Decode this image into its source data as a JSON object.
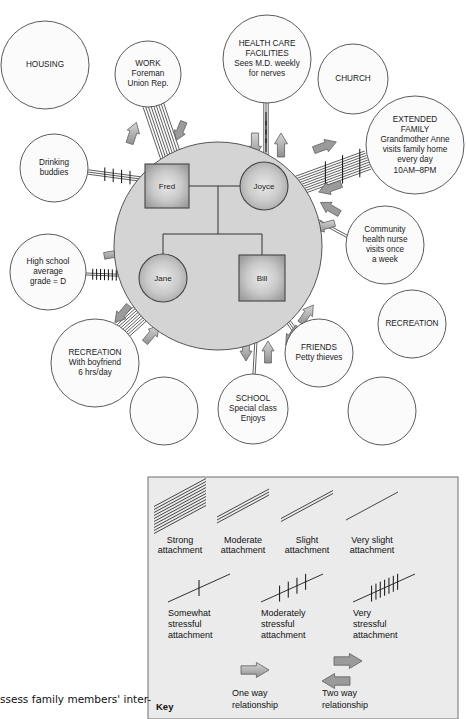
{
  "figure": {
    "type": "ecomap",
    "caption": "ssess family members' inter-"
  },
  "family": {
    "label": "family-unit",
    "members": [
      {
        "name": "Fred",
        "shape": "square",
        "role": "father"
      },
      {
        "name": "Joyce",
        "shape": "circle",
        "role": "mother"
      },
      {
        "name": "Jane",
        "shape": "circle",
        "role": "daughter"
      },
      {
        "name": "Bill",
        "shape": "square",
        "role": "son"
      }
    ]
  },
  "eco_nodes": [
    {
      "id": "housing",
      "lines": [
        "HOUSING"
      ],
      "empty": false
    },
    {
      "id": "work",
      "lines": [
        "WORK",
        "Foreman",
        "Union Rep."
      ],
      "empty": false
    },
    {
      "id": "health_care",
      "lines": [
        "HEALTH CARE",
        "FACILITIES",
        "Sees M.D. weekly",
        "for nerves"
      ],
      "empty": false
    },
    {
      "id": "church",
      "lines": [
        "CHURCH"
      ],
      "empty": false
    },
    {
      "id": "extended_family",
      "lines": [
        "EXTENDED",
        "FAMILY",
        "Grandmother Anne",
        "visits family home",
        "every day",
        "10AM–8PM"
      ],
      "empty": false
    },
    {
      "id": "drinking_buddies",
      "lines": [
        "Drinking",
        "buddies"
      ],
      "empty": false
    },
    {
      "id": "community_nurse",
      "lines": [
        "Community",
        "health nurse",
        "visits once",
        "a week"
      ],
      "empty": false
    },
    {
      "id": "high_school",
      "lines": [
        "High school",
        "average",
        "grade = D"
      ],
      "empty": false
    },
    {
      "id": "recreation_right",
      "lines": [
        "RECREATION"
      ],
      "empty": false
    },
    {
      "id": "recreation_jane",
      "lines": [
        "RECREATION",
        "With boyfriend",
        "6 hrs/day"
      ],
      "empty": false
    },
    {
      "id": "friends",
      "lines": [
        "FRIENDS",
        "Petty thieves"
      ],
      "empty": false
    },
    {
      "id": "school",
      "lines": [
        "SCHOOL",
        "Special class",
        "Enjoys"
      ],
      "empty": false
    },
    {
      "id": "blank_1",
      "lines": [],
      "empty": true
    },
    {
      "id": "blank_2",
      "lines": [],
      "empty": true
    },
    {
      "id": "blank_3",
      "lines": [],
      "empty": true
    }
  ],
  "connections": [
    {
      "from": "work",
      "to": "Fred",
      "attachment": "strong",
      "stress": "none",
      "direction": "two-way"
    },
    {
      "from": "drinking_buddies",
      "to": "Fred",
      "attachment": "moderate",
      "stress": "moderately",
      "direction": "none"
    },
    {
      "from": "health_care",
      "to": "Joyce",
      "attachment": "moderate",
      "stress": "moderately",
      "direction": "two-way"
    },
    {
      "from": "extended_family",
      "to": "Joyce",
      "attachment": "strong",
      "stress": "moderately",
      "direction": "two-way"
    },
    {
      "from": "community_nurse",
      "to": "Joyce",
      "attachment": "slight",
      "stress": "none",
      "direction": "two-way"
    },
    {
      "from": "high_school",
      "to": "Jane",
      "attachment": "slight",
      "stress": "very",
      "direction": "one-way"
    },
    {
      "from": "recreation_jane",
      "to": "Jane",
      "attachment": "strong",
      "stress": "none",
      "direction": "two-way"
    },
    {
      "from": "friends",
      "to": "Bill",
      "attachment": "moderate",
      "stress": "none",
      "direction": "two-way"
    },
    {
      "from": "school",
      "to": "Bill",
      "attachment": "slight",
      "stress": "none",
      "direction": "two-way"
    }
  ],
  "legend": {
    "key_word": "Key",
    "attachment_items": [
      {
        "label_line1": "Strong",
        "label_line2": "attachment",
        "lines": 10
      },
      {
        "label_line1": "Moderate",
        "label_line2": "attachment",
        "lines": 3
      },
      {
        "label_line1": "Slight",
        "label_line2": "attachment",
        "lines": 2
      },
      {
        "label_line1": "Very slight",
        "label_line2": "attachment",
        "lines": 1
      }
    ],
    "stress_items": [
      {
        "label_line1": "Somewhat",
        "label_line2": "stressful",
        "label_line3": "attachment",
        "hashes": 1
      },
      {
        "label_line1": "Moderately",
        "label_line2": "stressful",
        "label_line3": "attachment",
        "hashes": 4
      },
      {
        "label_line1": "Very",
        "label_line2": "stressful",
        "label_line3": "attachment",
        "hashes": 7
      }
    ],
    "relationship_items": [
      {
        "label_line1": "One way",
        "label_line2": "relationship",
        "arrows": 1
      },
      {
        "label_line1": "Two way",
        "label_line2": "relationship",
        "arrows": 2
      }
    ]
  },
  "colors": {
    "eco_circle_fill": "#fbfbfb",
    "eco_circle_stroke": "#4a4a4a",
    "family_circle_fill": "#d4d4d4",
    "member_fill": "#b9b9b9",
    "arrow_fill": "#a8a8a8",
    "legend_box_fill": "#ebebeb",
    "line_color": "#2a2a2a"
  }
}
